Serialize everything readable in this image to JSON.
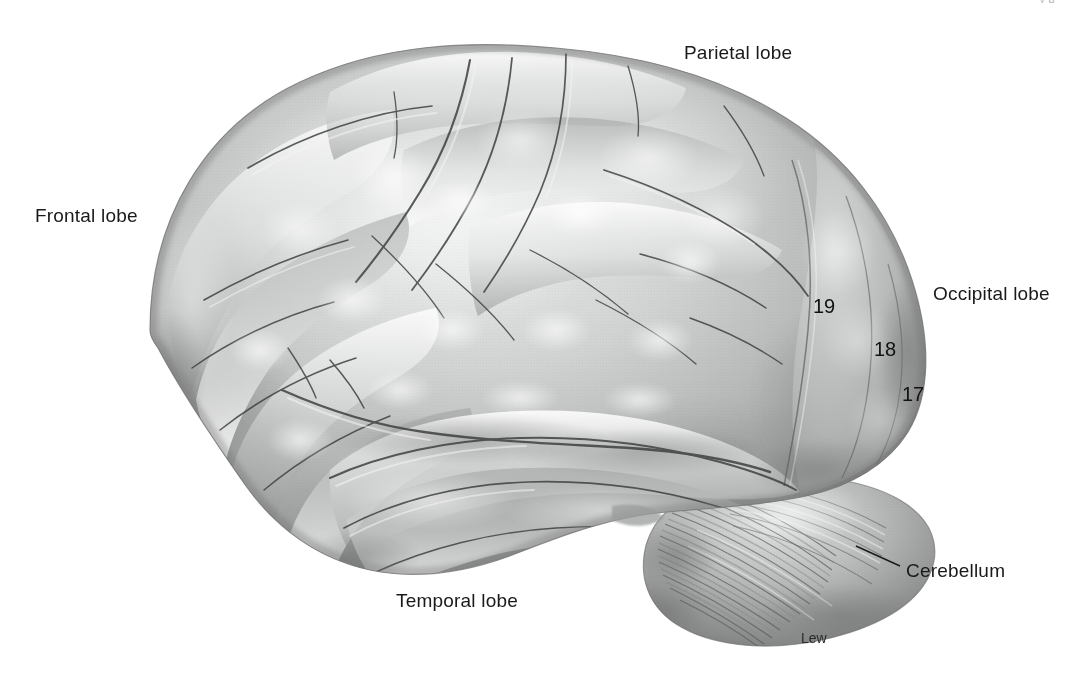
{
  "figure": {
    "style": "grayscale stippled anatomical illustration",
    "background_color": "#ffffff",
    "ink_color": "#1a1a1a",
    "running_head": "y g"
  },
  "labels": [
    {
      "id": "frontal",
      "text": "Frontal lobe",
      "x": 35,
      "y": 206
    },
    {
      "id": "parietal",
      "text": "Parietal lobe",
      "x": 684,
      "y": 43
    },
    {
      "id": "occipital",
      "text": "Occipital lobe",
      "x": 933,
      "y": 284
    },
    {
      "id": "temporal",
      "text": "Temporal lobe",
      "x": 396,
      "y": 591
    },
    {
      "id": "cerebellum",
      "text": "Cerebellum",
      "x": 906,
      "y": 561
    }
  ],
  "brodmann_areas": [
    {
      "number": "19",
      "name": "associative visual cortex",
      "x": 813,
      "y": 296
    },
    {
      "number": "18",
      "name": "secondary visual cortex",
      "x": 874,
      "y": 339
    },
    {
      "number": "17",
      "name": "primary visual cortex",
      "x": 902,
      "y": 384
    }
  ],
  "leader_lines": [
    {
      "id": "cerebellum-leader",
      "from_x": 856,
      "from_y": 546,
      "to_x": 900,
      "to_y": 566
    }
  ],
  "signature": {
    "text": "Lew",
    "x": 801,
    "y": 631
  },
  "palette": {
    "paper": "#ffffff",
    "cortex_light": "#f2f2f2",
    "cortex_mid": "#b6b6b6",
    "cortex_shadow": "#7c7c7c",
    "sulcus_line": "#4a4a4a",
    "cerebellum_mid": "#9a9a9a",
    "label_ink": "#1a1a1a"
  }
}
